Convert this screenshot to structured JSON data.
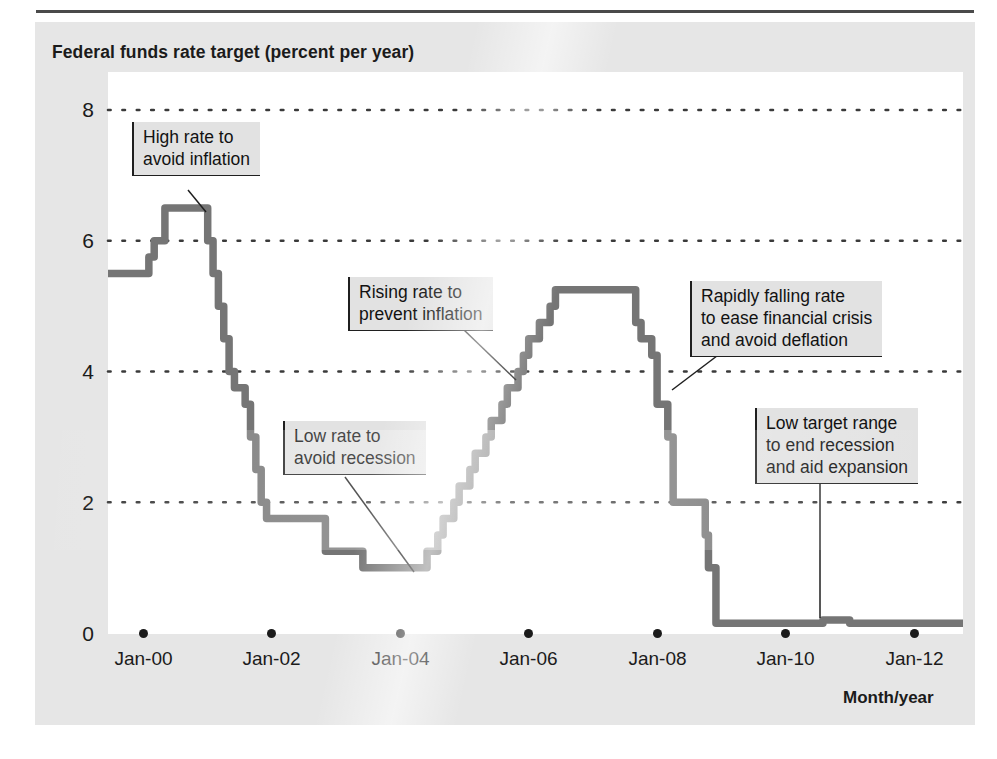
{
  "figure": {
    "panel_title": "Federal funds rate target (percent per year)",
    "x_axis_title": "Month/year"
  },
  "colors": {
    "line": "#757575",
    "text": "#1b1b1b",
    "panel_bg": "#e6e6e6",
    "plot_bg": "#ffffff",
    "annotation_bg": "#e2e2e2",
    "gridline": "#3a3a3a"
  },
  "chart_data": {
    "type": "line",
    "title": "Federal funds rate target (percent per year)",
    "subtitle": "",
    "xlabel": "Month/year",
    "ylabel": "Federal funds rate target (percent per year)",
    "xlim": [
      "Jan-00",
      "Jan-12"
    ],
    "ylim": [
      0,
      8
    ],
    "yticks": [
      0,
      2,
      4,
      6,
      8
    ],
    "xticks": [
      "Jan-00",
      "Jan-02",
      "Jan-04",
      "Jan-06",
      "Jan-08",
      "Jan-10",
      "Jan-12"
    ],
    "grid": "horizontal dotted",
    "legend": "none",
    "line_style": "step",
    "series": [
      {
        "name": "Federal funds rate target",
        "x": [
          "Jan-00",
          "Feb-00",
          "Mar-00",
          "May-00",
          "Jan-01",
          "Feb-01",
          "Mar-01",
          "Apr-01",
          "May-01",
          "Jun-01",
          "Aug-01",
          "Sep-01",
          "Oct-01",
          "Nov-01",
          "Dec-01",
          "Nov-02",
          "Jun-03",
          "Jun-04",
          "Aug-04",
          "Sep-04",
          "Nov-04",
          "Dec-04",
          "Feb-05",
          "Mar-05",
          "May-05",
          "Jun-05",
          "Aug-05",
          "Sep-05",
          "Nov-05",
          "Dec-05",
          "Jan-06",
          "Mar-06",
          "May-06",
          "Jun-06",
          "Sep-07",
          "Oct-07",
          "Dec-07",
          "Jan-08",
          "Mar-08",
          "Apr-08",
          "Oct-08",
          "Oct-08b",
          "Dec-08",
          "Aug-10",
          "Jan-11",
          "Jan-12"
        ],
        "values": [
          5.5,
          5.75,
          6.0,
          6.5,
          6.0,
          5.5,
          5.0,
          4.5,
          4.0,
          3.75,
          3.5,
          3.0,
          2.5,
          2.0,
          1.75,
          1.25,
          1.0,
          1.25,
          1.5,
          1.75,
          2.0,
          2.25,
          2.5,
          2.75,
          3.0,
          3.25,
          3.5,
          3.75,
          4.0,
          4.25,
          4.5,
          4.75,
          5.0,
          5.25,
          4.75,
          4.5,
          4.25,
          3.5,
          3.0,
          2.0,
          1.5,
          1.0,
          0.15,
          0.2,
          0.15,
          0.15
        ]
      }
    ],
    "annotations": [
      {
        "id": "high-rate",
        "text": "High rate to\navoid inflation"
      },
      {
        "id": "low-rate",
        "text": "Low rate to\navoid recession"
      },
      {
        "id": "rising-rate",
        "text": "Rising rate to\nprevent inflation"
      },
      {
        "id": "falling-rate",
        "text": "Rapidly falling rate\nto ease financial crisis\nand avoid deflation"
      },
      {
        "id": "low-target",
        "text": "Low target range\nto end recession\nand aid expansion"
      }
    ]
  },
  "y_axis": {
    "ticks": [
      {
        "label": "8"
      },
      {
        "label": "6"
      },
      {
        "label": "4"
      },
      {
        "label": "2"
      },
      {
        "label": "0"
      }
    ]
  },
  "x_axis": {
    "ticks": [
      {
        "label": "Jan-00"
      },
      {
        "label": "Jan-02"
      },
      {
        "label": "Jan-04"
      },
      {
        "label": "Jan-06"
      },
      {
        "label": "Jan-08"
      },
      {
        "label": "Jan-10"
      },
      {
        "label": "Jan-12"
      }
    ]
  }
}
